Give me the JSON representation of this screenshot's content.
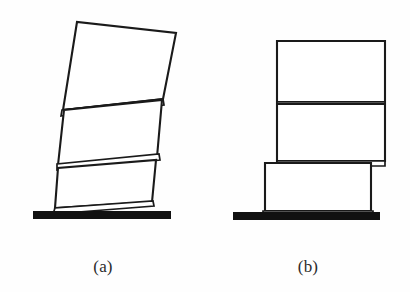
{
  "figure": {
    "kind": "line-drawing",
    "background_color": "#fefefe",
    "line_color": "#1a1a1a",
    "ground_color": "#111111",
    "block_fill": "#ffffff",
    "panels": [
      {
        "id": "panel-a",
        "caption": "(a)",
        "caption_x": 103,
        "caption_y": 272,
        "state": "rocking / tilted stack",
        "ground": {
          "x": 33,
          "y": 211,
          "width": 138,
          "height": 8
        },
        "blocks": [
          {
            "name": "bottom-block",
            "points": "55,208 152,202 156,160 58,168"
          },
          {
            "name": "bottom-block-sliver",
            "points": "53,214 154,206 153,201 55,208"
          },
          {
            "name": "middle-block",
            "points": "58,165 157,157 162,100 64,110"
          },
          {
            "name": "middle-block-sliver",
            "points": "57,170 160,160 159,154 57,164"
          },
          {
            "name": "top-block",
            "points": "63,110 163,99 176,33 77,22"
          },
          {
            "name": "top-block-sliver",
            "points": "61,116 164,105 163,99 62,110"
          }
        ]
      },
      {
        "id": "panel-b",
        "caption": "(b)",
        "caption_x": 308,
        "caption_y": 272,
        "state": "upright stack with base offset / sliding",
        "ground": {
          "x": 233,
          "y": 212,
          "width": 147,
          "height": 8
        },
        "blocks": [
          {
            "name": "bottom-block",
            "points": "265,211 371,211 371,163 265,163"
          },
          {
            "name": "bottom-block-sliver",
            "points": "263,216 373,216 373,211 263,211"
          },
          {
            "name": "middle-block",
            "points": "277,161 385,161 385,104 277,104"
          },
          {
            "name": "middle-block-sliver",
            "points": "277,166 385,166 385,161 277,161"
          },
          {
            "name": "top-block",
            "points": "277,102 385,102 385,41 277,41"
          },
          {
            "name": "top-block-sliver",
            "points": "277,107 385,107 385,102 277,102"
          }
        ]
      }
    ]
  }
}
